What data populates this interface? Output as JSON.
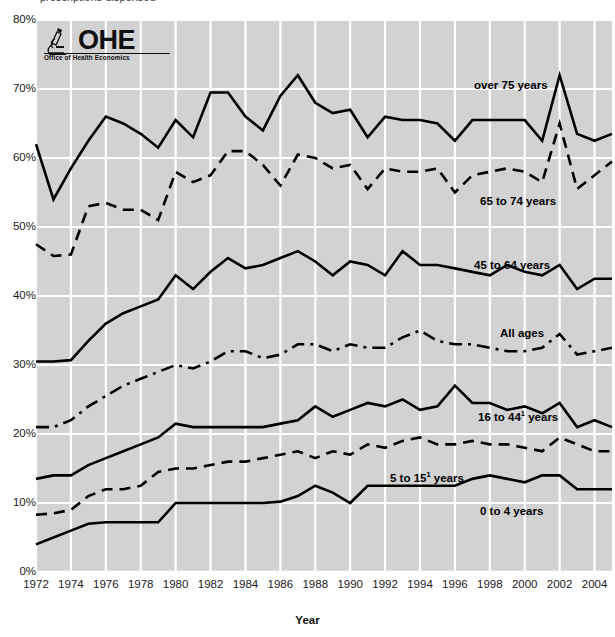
{
  "title_clipped": "prescriptions dispensed",
  "logo": {
    "name": "OHE",
    "subtitle": "Office of Health Economics",
    "icon": "microscope-icon"
  },
  "axes": {
    "x_title": "Year",
    "y_ticks": [
      "0%",
      "10%",
      "20%",
      "30%",
      "40%",
      "50%",
      "60%",
      "70%",
      "80%"
    ],
    "x_ticks": [
      "1972",
      "1974",
      "1976",
      "1978",
      "1980",
      "1982",
      "1984",
      "1986",
      "1988",
      "1990",
      "1992",
      "1994",
      "1996",
      "1998",
      "2000",
      "2002",
      "2004"
    ]
  },
  "colors": {
    "plot_background": "#d2d2d2",
    "gridline": "#ffffff",
    "line": "#000000",
    "text": "#1a1a1a"
  },
  "chart_data": {
    "type": "line",
    "title": "prescriptions dispensed",
    "xlabel": "Year",
    "ylabel": "",
    "xlim": [
      1972,
      2005
    ],
    "ylim": [
      0,
      80
    ],
    "grid": true,
    "legend_position": "inline-annotations",
    "x": [
      1972,
      1973,
      1974,
      1975,
      1976,
      1977,
      1978,
      1979,
      1980,
      1981,
      1982,
      1983,
      1984,
      1985,
      1986,
      1987,
      1988,
      1989,
      1990,
      1991,
      1992,
      1993,
      1994,
      1995,
      1996,
      1997,
      1998,
      1999,
      2000,
      2001,
      2002,
      2003,
      2004,
      2005
    ],
    "series": [
      {
        "name": "over 75 years",
        "label": "over 75 years",
        "style": "solid",
        "values": [
          62.0,
          54.0,
          58.5,
          62.5,
          66.0,
          65.0,
          63.5,
          61.5,
          65.5,
          63.0,
          69.5,
          69.5,
          66.0,
          64.0,
          69.0,
          72.0,
          68.0,
          66.5,
          67.0,
          63.0,
          66.0,
          65.5,
          65.5,
          65.0,
          62.5,
          65.5,
          65.5,
          65.5,
          65.5,
          62.5,
          72.0,
          63.5,
          62.5,
          63.5
        ]
      },
      {
        "name": "65 to 74 years",
        "label": "65 to 74 years",
        "style": "dashed",
        "values": [
          47.5,
          45.8,
          46.0,
          53.0,
          53.5,
          52.5,
          52.5,
          51.0,
          58.0,
          56.5,
          57.5,
          61.0,
          61.0,
          59.0,
          56.0,
          60.5,
          60.0,
          58.5,
          59.0,
          55.5,
          58.5,
          58.0,
          58.0,
          58.5,
          55.0,
          57.5,
          58.0,
          58.5,
          58.0,
          56.5,
          65.0,
          55.5,
          57.5,
          59.5
        ]
      },
      {
        "name": "45 to 64 years",
        "label": "45 to 64 years",
        "style": "solid",
        "values": [
          30.5,
          30.5,
          30.7,
          33.5,
          36.0,
          37.5,
          38.5,
          39.5,
          43.0,
          41.0,
          43.5,
          45.5,
          44.0,
          44.5,
          45.5,
          46.5,
          45.0,
          43.0,
          45.0,
          44.5,
          43.0,
          46.5,
          44.5,
          44.5,
          44.0,
          43.5,
          43.0,
          44.5,
          43.5,
          43.0,
          44.5,
          41.0,
          42.5,
          42.5
        ]
      },
      {
        "name": "All ages",
        "label": "All ages",
        "style": "dash-dot",
        "values": [
          21.0,
          21.0,
          22.0,
          24.0,
          25.5,
          27.0,
          28.0,
          29.0,
          30.0,
          29.5,
          30.5,
          32.0,
          32.0,
          31.0,
          31.5,
          33.0,
          33.0,
          32.0,
          33.0,
          32.5,
          32.5,
          34.0,
          35.0,
          33.5,
          33.0,
          33.0,
          32.5,
          32.0,
          32.0,
          32.5,
          34.5,
          31.5,
          32.0,
          32.5
        ]
      },
      {
        "name": "16 to 44 years",
        "label": "16 to 44¹ years",
        "style": "solid",
        "values": [
          13.5,
          14.0,
          14.0,
          15.5,
          16.5,
          17.5,
          18.5,
          19.5,
          21.5,
          21.0,
          21.0,
          21.0,
          21.0,
          21.0,
          21.5,
          22.0,
          24.0,
          22.5,
          23.5,
          24.5,
          24.0,
          25.0,
          23.5,
          24.0,
          27.0,
          24.5,
          24.5,
          23.5,
          24.0,
          23.0,
          24.5,
          21.0,
          22.0,
          21.0
        ]
      },
      {
        "name": "5 to 15 years",
        "label": "5 to 15¹ years",
        "style": "dashed",
        "values": [
          8.3,
          8.5,
          9.0,
          11.0,
          12.0,
          12.0,
          12.5,
          14.5,
          15.0,
          15.0,
          15.5,
          16.0,
          16.0,
          16.5,
          17.0,
          17.5,
          16.5,
          17.5,
          17.0,
          18.5,
          18.0,
          19.0,
          19.5,
          18.5,
          18.5,
          19.0,
          18.5,
          18.5,
          18.0,
          17.5,
          19.5,
          18.5,
          17.5,
          17.5
        ]
      },
      {
        "name": "0 to 4 years",
        "label": "0 to 4 years",
        "style": "solid",
        "values": [
          4.0,
          5.0,
          6.0,
          7.0,
          7.2,
          7.2,
          7.2,
          7.2,
          10.0,
          10.0,
          10.0,
          10.0,
          10.0,
          10.0,
          10.2,
          11.0,
          12.5,
          11.5,
          10.0,
          12.5,
          12.5,
          12.5,
          12.5,
          12.5,
          12.5,
          13.5,
          14.0,
          13.5,
          13.0,
          14.0,
          14.0,
          12.0,
          12.0,
          12.0
        ]
      }
    ]
  },
  "annotations": [
    {
      "text": "over 75 years",
      "x": 474,
      "y": 79
    },
    {
      "text_html": "65 to 74 years",
      "x": 480,
      "y": 195
    },
    {
      "text": "45 to 64 years",
      "x": 474,
      "y": 259
    },
    {
      "text": "All ages",
      "x": 500,
      "y": 327
    },
    {
      "text_html": "16 to 44¹ years",
      "x": 478,
      "y": 409
    },
    {
      "text_html": "5 to 15¹ years",
      "x": 390,
      "y": 470
    },
    {
      "text": "0 to 4 years",
      "x": 480,
      "y": 505
    }
  ]
}
